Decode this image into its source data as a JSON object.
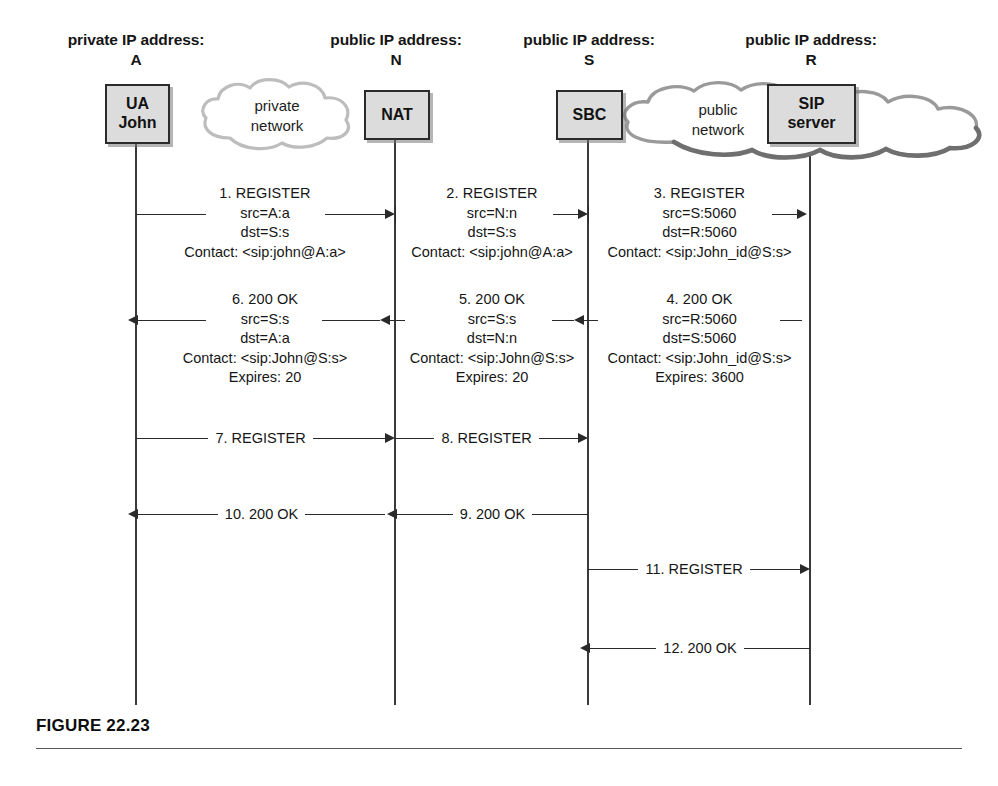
{
  "figure": {
    "caption": "FIGURE 22.23"
  },
  "columns": [
    {
      "addr_label": "private IP address:",
      "addr_id": "A",
      "node_lines": [
        "UA",
        "John"
      ],
      "lifeline_x": 136
    },
    {
      "addr_label": "public IP address:",
      "addr_id": "N",
      "node_lines": [
        "NAT"
      ],
      "lifeline_x": 395
    },
    {
      "addr_label": "public IP address:",
      "addr_id": "S",
      "node_lines": [
        "SBC"
      ],
      "lifeline_x": 588
    },
    {
      "addr_label": "public IP address:",
      "addr_id": "R",
      "node_lines": [
        "SIP",
        "server"
      ],
      "lifeline_x": 810
    }
  ],
  "clouds": [
    {
      "name": "private-network-cloud",
      "lines": [
        "private",
        "network"
      ]
    },
    {
      "name": "public-network-cloud",
      "lines": [
        "public",
        "network"
      ]
    }
  ],
  "messages": [
    {
      "id": "1",
      "title": "1. REGISTER",
      "lines": [
        "src=A:a",
        "dst=S:s",
        "Contact: <sip:john@A:a>"
      ],
      "from": "A",
      "to": "N",
      "direction": "right"
    },
    {
      "id": "2",
      "title": "2. REGISTER",
      "lines": [
        "src=N:n",
        "dst=S:s",
        "Contact: <sip:john@A:a>"
      ],
      "from": "N",
      "to": "S",
      "direction": "right"
    },
    {
      "id": "3",
      "title": "3. REGISTER",
      "lines": [
        "src=S:5060",
        "dst=R:5060",
        "Contact: <sip:John_id@S:s>"
      ],
      "from": "S",
      "to": "R",
      "direction": "right"
    },
    {
      "id": "4",
      "title": "4. 200 OK",
      "lines": [
        "src=R:5060",
        "dst=S:5060",
        "Contact: <sip:John_id@S:s>",
        "Expires: 3600"
      ],
      "from": "R",
      "to": "S",
      "direction": "left"
    },
    {
      "id": "5",
      "title": "5. 200 OK",
      "lines": [
        "src=S:s",
        "dst=N:n",
        "Contact: <sip:John@S:s>",
        "Expires: 20"
      ],
      "from": "S",
      "to": "N",
      "direction": "left"
    },
    {
      "id": "6",
      "title": "6. 200 OK",
      "lines": [
        "src=S:s",
        "dst=A:a",
        "Contact: <sip:John@S:s>",
        "Expires: 20"
      ],
      "from": "N",
      "to": "A",
      "direction": "left"
    },
    {
      "id": "7",
      "title": "7. REGISTER",
      "lines": [],
      "from": "A",
      "to": "N",
      "direction": "right"
    },
    {
      "id": "8",
      "title": "8. REGISTER",
      "lines": [],
      "from": "N",
      "to": "S",
      "direction": "right"
    },
    {
      "id": "9",
      "title": "9. 200 OK",
      "lines": [],
      "from": "S",
      "to": "N",
      "direction": "left"
    },
    {
      "id": "10",
      "title": "10. 200 OK",
      "lines": [],
      "from": "N",
      "to": "A",
      "direction": "left"
    },
    {
      "id": "11",
      "title": "11. REGISTER",
      "lines": [],
      "from": "S",
      "to": "R",
      "direction": "right"
    },
    {
      "id": "12",
      "title": "12. 200 OK",
      "lines": [],
      "from": "R",
      "to": "S",
      "direction": "left"
    }
  ],
  "colors": {
    "node_fill": "#dcdcdc",
    "node_border": "#2b2b2b",
    "line": "#2a2a2a",
    "cloud_stroke": "#b5b5b5",
    "text": "#161616"
  }
}
